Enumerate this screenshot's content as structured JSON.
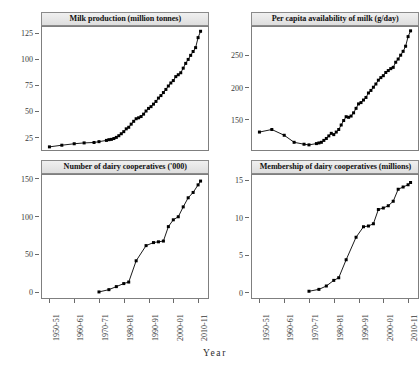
{
  "figure": {
    "layout": "2x2 trellis",
    "x_axis_title": "Year",
    "x_tick_labels": [
      "1950-51",
      "1960-61",
      "1970-71",
      "1980-81",
      "1990-91",
      "2000-01",
      "2010-11"
    ],
    "line_color": "#000000",
    "point_color": "#000000",
    "strip_background": "#e6e6e6",
    "panel_border": "#7f7f7f"
  },
  "panels": {
    "milk_production": {
      "title": "Milk production (million tonnes)",
      "y_ticks": [
        "25",
        "50",
        "75",
        "100",
        "125"
      ]
    },
    "per_capita": {
      "title": "Per capita availability of milk (g/day)",
      "y_ticks": [
        "150",
        "200",
        "250"
      ]
    },
    "cooperatives": {
      "title": "Number of dairy cooperatives ('000)",
      "y_ticks": [
        "0",
        "50",
        "100",
        "150"
      ]
    },
    "membership": {
      "title": "Membership of dairy cooperatives (millions)",
      "y_ticks": [
        "0",
        "5",
        "10",
        "15"
      ]
    }
  },
  "chart_data": [
    {
      "type": "line",
      "title": "Milk production (million tonnes)",
      "xlabel": "Year",
      "ylabel": "Milk production (million tonnes)",
      "x_tick_labels": [
        "1950-51",
        "1960-61",
        "1970-71",
        "1980-81",
        "1990-91",
        "2000-01",
        "2010-11"
      ],
      "x_tick_values": [
        1950,
        1960,
        1970,
        1980,
        1990,
        2000,
        2010
      ],
      "xlim": [
        1947,
        2014
      ],
      "ylim": [
        14,
        132
      ],
      "grid": false,
      "legend": "none",
      "markers": "filled square",
      "x": [
        1950,
        1955,
        1960,
        1964,
        1968,
        1970,
        1973,
        1974,
        1975,
        1976,
        1977,
        1978,
        1979,
        1980,
        1981,
        1982,
        1983,
        1984,
        1985,
        1986,
        1987,
        1988,
        1989,
        1990,
        1991,
        1992,
        1993,
        1994,
        1995,
        1996,
        1997,
        1998,
        1999,
        2000,
        2001,
        2002,
        2003,
        2004,
        2005,
        2006,
        2007,
        2008,
        2009,
        2010,
        2011
      ],
      "values": [
        17.0,
        18.6,
        20.0,
        20.8,
        21.2,
        22.0,
        23.2,
        23.9,
        24.2,
        25.0,
        26.1,
        27.7,
        29.6,
        31.6,
        34.3,
        35.8,
        38.8,
        41.5,
        44.0,
        44.9,
        46.1,
        48.4,
        51.4,
        53.9,
        55.6,
        58.0,
        60.6,
        63.8,
        66.2,
        69.1,
        72.1,
        75.4,
        78.3,
        80.6,
        84.4,
        86.2,
        88.1,
        92.5,
        97.1,
        100.9,
        104.8,
        108.5,
        112.2,
        121.8,
        127.9
      ]
    },
    {
      "type": "line",
      "title": "Per capita availability of milk (g/day)",
      "xlabel": "Year",
      "ylabel": "Per capita availability of milk (g/day)",
      "x_tick_labels": [
        "1950-51",
        "1960-61",
        "1970-71",
        "1980-81",
        "1990-91",
        "2000-01",
        "2010-11"
      ],
      "x_tick_values": [
        1950,
        1960,
        1970,
        1980,
        1990,
        2000,
        2010
      ],
      "xlim": [
        1947,
        2014
      ],
      "ylim": [
        104,
        296
      ],
      "grid": false,
      "legend": "none",
      "markers": "filled square",
      "x": [
        1950,
        1955,
        1960,
        1964,
        1968,
        1970,
        1973,
        1974,
        1975,
        1976,
        1977,
        1978,
        1979,
        1980,
        1981,
        1982,
        1983,
        1984,
        1985,
        1986,
        1987,
        1988,
        1989,
        1990,
        1991,
        1992,
        1993,
        1994,
        1995,
        1996,
        1997,
        1998,
        1999,
        2000,
        2001,
        2002,
        2003,
        2004,
        2005,
        2006,
        2007,
        2008,
        2009,
        2010,
        2011
      ],
      "values": [
        132,
        136,
        127,
        116,
        113,
        112,
        114,
        115,
        116,
        119,
        122,
        126,
        130,
        128,
        132,
        136,
        143,
        150,
        156,
        155,
        157,
        162,
        169,
        176,
        178,
        182,
        186,
        193,
        197,
        202,
        207,
        213,
        217,
        220,
        225,
        228,
        231,
        233,
        241,
        246,
        252,
        258,
        266,
        281,
        290
      ]
    },
    {
      "type": "line",
      "title": "Number of dairy cooperatives ('000)",
      "xlabel": "Year",
      "ylabel": "Number of dairy cooperatives ('000)",
      "x_tick_labels": [
        "1950-51",
        "1960-61",
        "1970-71",
        "1980-81",
        "1990-91",
        "2000-01",
        "2010-11"
      ],
      "x_tick_values": [
        1950,
        1960,
        1970,
        1980,
        1990,
        2000,
        2010
      ],
      "xlim": [
        1947,
        2014
      ],
      "ylim": [
        -6,
        156
      ],
      "grid": false,
      "legend": "none",
      "markers": "filled square",
      "x": [
        1970,
        1974,
        1977,
        1980,
        1982,
        1985,
        1989,
        1992,
        1994,
        1996,
        1998,
        2000,
        2002,
        2004,
        2006,
        2008,
        2010,
        2011
      ],
      "values": [
        2,
        5,
        9,
        13,
        15,
        43,
        63,
        67,
        68,
        69,
        88,
        97,
        101,
        114,
        126,
        133,
        143,
        148
      ]
    },
    {
      "type": "line",
      "title": "Membership of dairy cooperatives (millions)",
      "xlabel": "Year",
      "ylabel": "Membership of dairy cooperatives (millions)",
      "x_tick_labels": [
        "1950-51",
        "1960-61",
        "1970-71",
        "1980-81",
        "1990-91",
        "2000-01",
        "2010-11"
      ],
      "x_tick_values": [
        1950,
        1960,
        1970,
        1980,
        1990,
        2000,
        2010
      ],
      "xlim": [
        1947,
        2014
      ],
      "ylim": [
        -0.6,
        15.8
      ],
      "grid": false,
      "legend": "none",
      "markers": "filled square",
      "x": [
        1970,
        1974,
        1977,
        1980,
        1982,
        1985,
        1989,
        1992,
        1994,
        1996,
        1998,
        2000,
        2002,
        2004,
        2006,
        2008,
        2010,
        2011
      ],
      "values": [
        0.3,
        0.55,
        1.0,
        1.75,
        2.1,
        4.5,
        7.5,
        8.9,
        9.0,
        9.3,
        11.2,
        11.4,
        11.7,
        12.3,
        13.9,
        14.2,
        14.5,
        14.8
      ]
    }
  ]
}
